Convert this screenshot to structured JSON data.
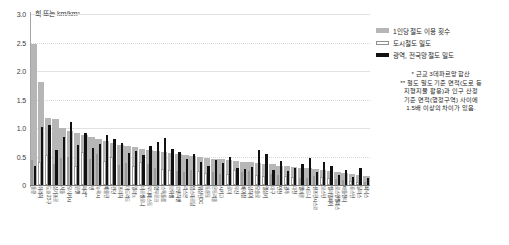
{
  "chart_data": {
    "type": "bar",
    "title": "",
    "unit_label": "회 또는 km/km²",
    "ylabel": "회 또는 km/km²",
    "xlabel": "",
    "ylim": [
      0,
      3.0
    ],
    "yticks": [
      "0",
      "0.5",
      "1.0",
      "1.5",
      "2.0",
      "2.5",
      "3.0"
    ],
    "ytick_values": [
      0,
      0.5,
      1.0,
      1.5,
      2.0,
      2.5,
      3.0
    ],
    "grid": true,
    "legend_position": "top-right",
    "categories": [
      "홍콩",
      "취리히",
      "도쿄 23구",
      "싱가포르",
      "서울",
      "오사카시",
      "뮌헨",
      "파리**",
      "빈",
      "뉴욕시",
      "베를린",
      "런던",
      "프라하",
      "마드리드",
      "밀라노",
      "바르셀로나",
      "부다페스트",
      "함부르크",
      "스톡홀름",
      "브뤼셀",
      "코펜하겐",
      "리스본",
      "암스테르담",
      "워싱턴DC",
      "토론토",
      "몬트리올",
      "시카고",
      "로마",
      "부산",
      "베이징",
      "상하이",
      "오슬로",
      "헬싱키",
      "대구",
      "인천",
      "광주",
      "대전",
      "멜버른",
      "시드니",
      "샌프란시스코",
      "보스턴",
      "필라델피아",
      "로스앤젤레스",
      "애틀랜타",
      "휴스턴",
      "달라스",
      "피닉스"
    ],
    "series": [
      {
        "name": "1인당 철도 이용 횟수",
        "color": "#b6b6b6",
        "values": [
          2.47,
          1.8,
          1.18,
          1.15,
          1.0,
          0.95,
          0.92,
          0.88,
          0.84,
          0.8,
          0.77,
          0.74,
          0.71,
          0.68,
          0.66,
          0.64,
          0.62,
          0.6,
          0.58,
          0.56,
          0.54,
          0.52,
          0.51,
          0.49,
          0.48,
          0.46,
          0.45,
          0.44,
          0.42,
          0.41,
          0.4,
          0.38,
          0.37,
          0.36,
          0.34,
          0.33,
          0.32,
          0.3,
          0.29,
          0.28,
          0.26,
          0.25,
          0.23,
          0.21,
          0.19,
          0.17,
          0.15
        ]
      },
      {
        "name": "도시철도 밀도",
        "color": "#ffffff",
        "values": [
          0.44,
          0.4,
          0.52,
          0.36,
          0.47,
          0.5,
          0.33,
          0.58,
          0.46,
          0.55,
          0.42,
          0.49,
          0.35,
          0.38,
          0.34,
          0.4,
          0.36,
          0.3,
          0.28,
          0.26,
          0.24,
          0.22,
          0.27,
          0.25,
          0.21,
          0.23,
          0.2,
          0.19,
          0.26,
          0.22,
          0.24,
          0.17,
          0.16,
          0.2,
          0.18,
          0.15,
          0.14,
          0.13,
          0.12,
          0.16,
          0.14,
          0.13,
          0.11,
          0.09,
          0.07,
          0.06,
          0.05
        ]
      },
      {
        "name": "광역, 전국망 철도 밀도",
        "color": "#111111",
        "values": [
          0.33,
          1.02,
          1.05,
          0.62,
          0.84,
          1.1,
          0.7,
          0.92,
          0.65,
          0.72,
          0.88,
          0.8,
          0.74,
          0.56,
          0.6,
          0.52,
          0.68,
          0.76,
          0.82,
          0.64,
          0.58,
          0.46,
          0.55,
          0.4,
          0.34,
          0.44,
          0.38,
          0.5,
          0.3,
          0.28,
          0.32,
          0.62,
          0.54,
          0.26,
          0.42,
          0.24,
          0.3,
          0.36,
          0.48,
          0.22,
          0.4,
          0.34,
          0.18,
          0.26,
          0.14,
          0.3,
          0.12
        ]
      }
    ]
  },
  "legend": {
    "items": [
      {
        "label": "1인당 철도 이용 횟수",
        "swatch": "gray"
      },
      {
        "label": "도시철도 밀도",
        "swatch": "white"
      },
      {
        "label": "광역, 전국망 철도 밀도",
        "swatch": "black"
      }
    ]
  },
  "notes": {
    "lines": [
      "* 근교 3데파르망 합산",
      "** 철도 밀도 기준 면적(도로 등",
      "지형지물 활용)과 인구 산정",
      "기준 면적(행정구역) 사이에",
      "1.5배 이상의 차이가 있음."
    ]
  }
}
